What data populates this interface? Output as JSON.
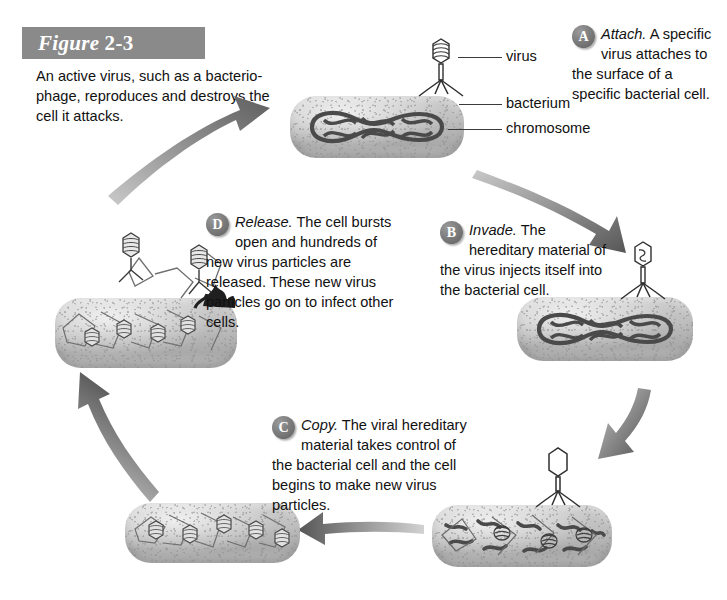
{
  "figure": {
    "label_word": "Figure",
    "label_number": "2-3",
    "caption": "An active virus, such as a bacterio-phage, reproduces and destroys the cell it attacks."
  },
  "labels": {
    "virus": "virus",
    "bacterium": "bacterium",
    "chromosome": "chromosome"
  },
  "steps": [
    {
      "badge": "A",
      "verb": "Attach.",
      "text": " A specific virus attaches to the surface of a specific bacterial cell."
    },
    {
      "badge": "B",
      "verb": "Invade.",
      "text": " The hereditary material of the virus injects itself into the bacterial cell."
    },
    {
      "badge": "C",
      "verb": "Copy.",
      "text": " The viral hereditary material takes control of the bacterial cell and the cell begins to make new virus particles."
    },
    {
      "badge": "D",
      "verb": "Release.",
      "text": " The cell bursts open and hundreds of new virus particles are released. These new virus particles go on to infect other cells."
    }
  ],
  "colors": {
    "title_bar": "#8a8a8a",
    "badge": "#7e7e7e",
    "arrow": "#6f6f6f",
    "cell_body": "#bdbdbd",
    "chromosome": "#4a4a4a",
    "text": "#111111"
  },
  "diagram": {
    "type": "cycle-diagram",
    "stage_count": 4,
    "cycle_direction": "clockwise",
    "stages": [
      {
        "id": "attach",
        "position": "top",
        "cell_contents": "intact chromosome loop, one phage attached on top"
      },
      {
        "id": "invade",
        "position": "right",
        "cell_contents": "intact chromosome loop, phage injecting through empty head"
      },
      {
        "id": "copy",
        "position": "bottom-right",
        "cell_contents": "fragmented hereditary material and coiled viral DNA"
      },
      {
        "id": "assemble",
        "position": "bottom-left",
        "cell_contents": "newly assembled virus particles"
      },
      {
        "id": "release",
        "position": "left",
        "cell_contents": "burst cell releasing virus particles"
      }
    ]
  }
}
